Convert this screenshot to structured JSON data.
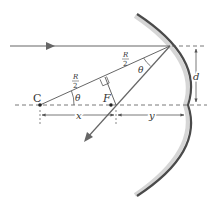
{
  "diagram": {
    "type": "concave-mirror-focal-geometry",
    "labels": {
      "center": "C",
      "focus": "F",
      "radius_half_top": "R",
      "radius_half_top_den": "2",
      "radius_half_left": "R",
      "radius_half_left_den": "2",
      "theta_at_C": "θ",
      "theta_at_mirror": "θ",
      "height": "d",
      "dist_x": "x",
      "dist_y": "y"
    },
    "colors": {
      "line": "#555555",
      "mirror_dark": "#444444",
      "mirror_light": "#cfcfcf",
      "text": "#333333"
    }
  }
}
